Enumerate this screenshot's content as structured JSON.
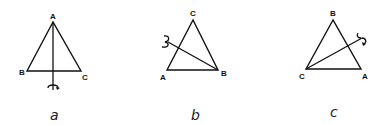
{
  "figures": [
    {
      "label": "a",
      "vertices": {
        "top": "A",
        "left": "B",
        "right": "C"
      },
      "axis": "vertical through A, perpendicular to BC",
      "rotation_icon": "rotation-arrow-icon"
    },
    {
      "label": "b",
      "vertices": {
        "top": "C",
        "left": "A",
        "right": "B"
      },
      "axis": "through B, bisecting AC",
      "rotation_icon": "rotation-arrow-icon"
    },
    {
      "label": "c",
      "vertices": {
        "top": "B",
        "left": "C",
        "right": "A"
      },
      "axis": "through C, bisecting AB",
      "rotation_icon": "rotation-arrow-icon"
    }
  ],
  "colors": {
    "stroke": "#111111",
    "background": "#ffffff"
  }
}
